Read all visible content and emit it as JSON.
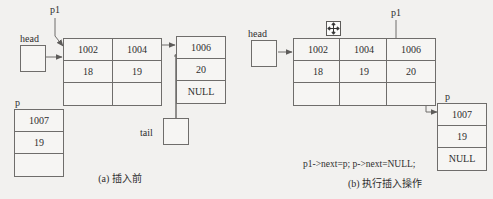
{
  "figure": {
    "title_a": "(a) 插入前",
    "title_b": "(b) 执行插入操作",
    "code_b": "p1->next=p; p->next=NULL;",
    "ink_color": "#6f6d6b",
    "text_color": "#2e2e2e",
    "background_color": "#f2f1ef"
  },
  "panel_a": {
    "labels": {
      "head": "head",
      "p1": "p1",
      "p": "p",
      "tail": "tail"
    },
    "nodes": [
      {
        "name": "node-1002",
        "address": "1002",
        "value": "18",
        "next": ""
      },
      {
        "name": "node-1004",
        "address": "1004",
        "value": "19",
        "next": ""
      },
      {
        "name": "node-1006",
        "address": "1006",
        "value": "20",
        "next": "NULL"
      }
    ],
    "detached": {
      "name": "node-1007",
      "address": "1007",
      "value": "19",
      "next": ""
    }
  },
  "panel_b": {
    "labels": {
      "head": "head",
      "p1": "p1",
      "p": "p"
    },
    "cursor_icon": "move-cursor-icon",
    "nodes": [
      {
        "name": "node-1002",
        "address": "1002",
        "value": "18",
        "next": ""
      },
      {
        "name": "node-1004",
        "address": "1004",
        "value": "19",
        "next": ""
      },
      {
        "name": "node-1006",
        "address": "1006",
        "value": "20",
        "next": ""
      }
    ],
    "inserted": {
      "name": "node-1007",
      "address": "1007",
      "value": "19",
      "next": "NULL"
    }
  }
}
